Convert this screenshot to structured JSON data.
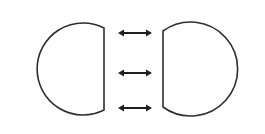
{
  "diagram": {
    "colors": {
      "background": "#ffffff",
      "stroke": "#2e2e2e",
      "arrow": "#1f1f1f"
    },
    "shapes": [
      {
        "name": "left-truncated-circle",
        "flat_side": "right",
        "center": [
          60,
          68
        ],
        "radius": 46,
        "flat_x": 104,
        "flat_top_y": 28,
        "flat_bottom_y": 110
      },
      {
        "name": "right-truncated-circle",
        "flat_side": "left",
        "center": [
          208,
          69
        ],
        "radius": 47,
        "flat_x": 163,
        "flat_top_y": 31,
        "flat_bottom_y": 107
      }
    ],
    "arrows": [
      {
        "name": "top",
        "type": "double-headed",
        "x1": 118,
        "x2": 152,
        "y": 33
      },
      {
        "name": "middle",
        "type": "double-headed",
        "x1": 118,
        "x2": 152,
        "y": 73
      },
      {
        "name": "bottom",
        "type": "double-headed",
        "x1": 118,
        "x2": 152,
        "y": 108
      }
    ]
  }
}
